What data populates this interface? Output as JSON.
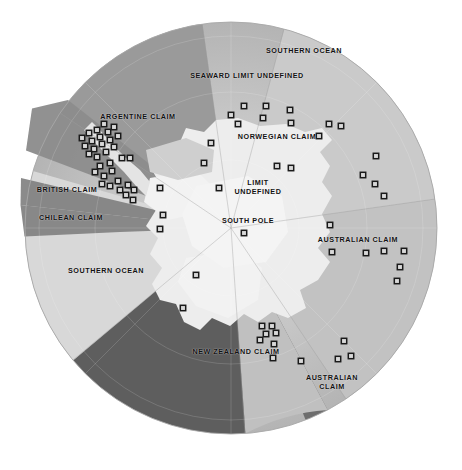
{
  "map": {
    "title": "Antarctic Territorial Claims",
    "projection": "south-polar-azimuthal",
    "background_color": "#ffffff",
    "center": {
      "x": 231,
      "y": 228
    },
    "radius": 206,
    "colors": {
      "ocean_outer": "#b9b9b9",
      "ocean_inner": "#c6c6c6",
      "ice_shelf": "#e9e9e9",
      "continent": "#efefef",
      "argentine": "#9a9a9a",
      "british": "#8d8d8d",
      "chilean": "#848484",
      "norwegian": "#cacaca",
      "australian": "#c2c2c2",
      "australian_west": "#c0c0c0",
      "new_zealand": "#5e5e5e",
      "unclaimed": "#d8d8d8",
      "divider_dark": "#6e6e6e",
      "station_outline": "#1a1a1a",
      "station_fill": "#d9d9d9",
      "label_text": "#121212"
    },
    "labels": [
      {
        "name": "label-southern-ocean-north",
        "text": "SOUTHERN OCEAN",
        "x": 304,
        "y": 51,
        "lines": 1
      },
      {
        "name": "label-seaward-limit-undefined",
        "text": "SEAWARD LIMIT UNDEFINED",
        "x": 247,
        "y": 76,
        "lines": 1
      },
      {
        "name": "label-argentine-claim",
        "text": "ARGENTINE CLAIM",
        "x": 138,
        "y": 117,
        "lines": 1
      },
      {
        "name": "label-norwegian-claim",
        "text": "NORWEGIAN CLAIM",
        "x": 277,
        "y": 137,
        "lines": 1
      },
      {
        "name": "label-limit-undefined",
        "text": "LIMIT\nUNDEFINED",
        "x": 258,
        "y": 187,
        "lines": 2
      },
      {
        "name": "label-british-claim",
        "text": "BRITISH CLAIM",
        "x": 67,
        "y": 190,
        "lines": 1
      },
      {
        "name": "label-chilean-claim",
        "text": "CHILEAN CLAIM",
        "x": 71,
        "y": 218,
        "lines": 1
      },
      {
        "name": "label-south-pole",
        "text": "SOUTH POLE",
        "x": 248,
        "y": 221,
        "lines": 1
      },
      {
        "name": "label-australian-claim-east",
        "text": "AUSTRALIAN CLAIM",
        "x": 358,
        "y": 240,
        "lines": 1
      },
      {
        "name": "label-southern-ocean-southwest",
        "text": "SOUTHERN OCEAN",
        "x": 106,
        "y": 271,
        "lines": 1
      },
      {
        "name": "label-new-zealand-claim",
        "text": "NEW ZEALAND CLAIM",
        "x": 236,
        "y": 352,
        "lines": 1
      },
      {
        "name": "label-australian-claim-south",
        "text": "AUSTRALIAN\nCLAIM",
        "x": 332,
        "y": 382,
        "lines": 2
      }
    ],
    "sectors": [
      {
        "name": "norwegian-claim-sector",
        "label": "NORWEGIAN CLAIM",
        "start_deg": -75,
        "end_deg": -8,
        "color_key": "norwegian"
      },
      {
        "name": "australian-claim-east-sector",
        "label": "AUSTRALIAN CLAIM",
        "start_deg": -8,
        "end_deg": 56,
        "color_key": "australian"
      },
      {
        "name": "australian-claim-south-sector",
        "label": "AUSTRALIAN CLAIM",
        "start_deg": 62,
        "end_deg": 86,
        "color_key": "australian_west"
      },
      {
        "name": "new-zealand-claim-sector",
        "label": "NEW ZEALAND CLAIM",
        "start_deg": 86,
        "end_deg": 140,
        "color_key": "new_zealand"
      },
      {
        "name": "unclaimed-sector",
        "label": "SOUTHERN OCEAN",
        "start_deg": 140,
        "end_deg": 196,
        "color_key": "unclaimed"
      },
      {
        "name": "chilean-claim-sector",
        "label": "CHILEAN CLAIM",
        "start_deg": 196,
        "end_deg": 214,
        "color_key": "chilean"
      },
      {
        "name": "british-claim-sector",
        "label": "BRITISH CLAIM",
        "start_deg": 203,
        "end_deg": 243,
        "color_key": "british"
      },
      {
        "name": "argentine-claim-sector",
        "label": "ARGENTINE CLAIM",
        "start_deg": 214,
        "end_deg": 262,
        "color_key": "argentine"
      }
    ],
    "south_pole_marker": {
      "name": "station-south-pole",
      "x": 244,
      "y": 233
    },
    "station_count": 74,
    "stations": [
      {
        "x": 231,
        "y": 115
      },
      {
        "x": 244,
        "y": 106
      },
      {
        "x": 238,
        "y": 124
      },
      {
        "x": 266,
        "y": 106
      },
      {
        "x": 263,
        "y": 118
      },
      {
        "x": 290,
        "y": 110
      },
      {
        "x": 291,
        "y": 123
      },
      {
        "x": 329,
        "y": 124
      },
      {
        "x": 341,
        "y": 126
      },
      {
        "x": 319,
        "y": 136
      },
      {
        "x": 211,
        "y": 143
      },
      {
        "x": 204,
        "y": 163
      },
      {
        "x": 376,
        "y": 156
      },
      {
        "x": 363,
        "y": 175
      },
      {
        "x": 375,
        "y": 184
      },
      {
        "x": 277,
        "y": 166
      },
      {
        "x": 291,
        "y": 168
      },
      {
        "x": 384,
        "y": 196
      },
      {
        "x": 219,
        "y": 188
      },
      {
        "x": 160,
        "y": 188
      },
      {
        "x": 330,
        "y": 225
      },
      {
        "x": 366,
        "y": 253
      },
      {
        "x": 332,
        "y": 252
      },
      {
        "x": 384,
        "y": 251
      },
      {
        "x": 404,
        "y": 251
      },
      {
        "x": 400,
        "y": 267
      },
      {
        "x": 397,
        "y": 281
      },
      {
        "x": 163,
        "y": 215
      },
      {
        "x": 160,
        "y": 229
      },
      {
        "x": 196,
        "y": 275
      },
      {
        "x": 183,
        "y": 308
      },
      {
        "x": 262,
        "y": 326
      },
      {
        "x": 272,
        "y": 326
      },
      {
        "x": 266,
        "y": 334
      },
      {
        "x": 276,
        "y": 333
      },
      {
        "x": 260,
        "y": 340
      },
      {
        "x": 274,
        "y": 344
      },
      {
        "x": 344,
        "y": 341
      },
      {
        "x": 351,
        "y": 356
      },
      {
        "x": 338,
        "y": 359
      },
      {
        "x": 301,
        "y": 361
      },
      {
        "x": 273,
        "y": 358
      },
      {
        "x": 104,
        "y": 124
      },
      {
        "x": 97,
        "y": 130
      },
      {
        "x": 89,
        "y": 133
      },
      {
        "x": 82,
        "y": 138
      },
      {
        "x": 92,
        "y": 141
      },
      {
        "x": 100,
        "y": 137
      },
      {
        "x": 108,
        "y": 132
      },
      {
        "x": 114,
        "y": 127
      },
      {
        "x": 85,
        "y": 146
      },
      {
        "x": 94,
        "y": 149
      },
      {
        "x": 102,
        "y": 144
      },
      {
        "x": 110,
        "y": 140
      },
      {
        "x": 118,
        "y": 136
      },
      {
        "x": 89,
        "y": 154
      },
      {
        "x": 97,
        "y": 157
      },
      {
        "x": 106,
        "y": 152
      },
      {
        "x": 114,
        "y": 147
      },
      {
        "x": 100,
        "y": 166
      },
      {
        "x": 110,
        "y": 163
      },
      {
        "x": 95,
        "y": 172
      },
      {
        "x": 104,
        "y": 176
      },
      {
        "x": 112,
        "y": 171
      },
      {
        "x": 102,
        "y": 184
      },
      {
        "x": 110,
        "y": 186
      },
      {
        "x": 118,
        "y": 181
      },
      {
        "x": 120,
        "y": 190
      },
      {
        "x": 128,
        "y": 185
      },
      {
        "x": 126,
        "y": 195
      },
      {
        "x": 134,
        "y": 190
      },
      {
        "x": 133,
        "y": 200
      },
      {
        "x": 122,
        "y": 158
      },
      {
        "x": 130,
        "y": 158
      }
    ]
  }
}
